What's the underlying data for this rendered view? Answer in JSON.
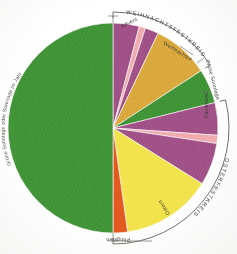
{
  "figure": {
    "type": "pie"
  },
  "arcs": {
    "weihnachtsfestkreis": "WEIHNACHTSFESTKREIS",
    "osterfestkreis": "OSTERFESTKREIS"
  },
  "labels": {
    "advent": "Advent",
    "weihnachten": "Weihnachten",
    "gruene_sonntage_short": "Grüne Sonntage",
    "fastenzeit": "Fastenzeit",
    "ostern": "Ostern",
    "pfingsten": "Pfingsten",
    "gruene_sonntage_long": "Grüne Sonntage oder Sonntage im Jahreskreis"
  },
  "colors": {
    "purple": "#9e4f84",
    "rose": "#efa9ad",
    "gold": "#d9a63c",
    "green": "#3f9136",
    "yellow": "#f2e34a",
    "orange": "#e2571f",
    "ink": "#3b3b36",
    "rule": "#5b5b55",
    "paper": "#ffffff"
  },
  "chart_data": {
    "type": "pie",
    "center": [
      113,
      128
    ],
    "radius": 105,
    "start_angle_deg": 0,
    "direction": "clockwise",
    "unit": "degrees",
    "legend": "none",
    "grid": false,
    "slices": [
      {
        "name": "Advent",
        "color": "#9e4f84",
        "start_deg": 0,
        "end_deg": 14.5,
        "value": 14.5
      },
      {
        "name": "Gaudete",
        "color": "#efa9ad",
        "start_deg": 14.5,
        "end_deg": 18.0,
        "value": 3.5
      },
      {
        "name": "Advent (Fortsetzung)",
        "color": "#9e4f84",
        "start_deg": 18.0,
        "end_deg": 25.5,
        "value": 7.5
      },
      {
        "name": "Weihnachten",
        "color": "#d9a63c",
        "start_deg": 25.5,
        "end_deg": 57.0,
        "value": 31.5
      },
      {
        "name": "Grüne Sonntage",
        "color": "#3f9136",
        "start_deg": 57.0,
        "end_deg": 76.0,
        "value": 19.0
      },
      {
        "name": "Fastenzeit",
        "color": "#9e4f84",
        "start_deg": 76.0,
        "end_deg": 94.0,
        "value": 18.0
      },
      {
        "name": "Laetare",
        "color": "#efa9ad",
        "start_deg": 94.0,
        "end_deg": 98.5,
        "value": 4.5
      },
      {
        "name": "Fastenzeit (Fortsetzung)",
        "color": "#9e4f84",
        "start_deg": 98.5,
        "end_deg": 122.0,
        "value": 23.5
      },
      {
        "name": "Ostern",
        "color": "#f2e34a",
        "start_deg": 122.0,
        "end_deg": 172.0,
        "value": 50.0
      },
      {
        "name": "Pfingsten",
        "color": "#e2571f",
        "start_deg": 172.0,
        "end_deg": 180.0,
        "value": 8.0
      },
      {
        "name": "Grüne Sonntage oder Sonntage im Jahreskreis",
        "color": "#3f9136",
        "start_deg": 180.0,
        "end_deg": 360.0,
        "value": 180.0
      }
    ],
    "brackets": [
      {
        "label": "WEIHNACHTSFESTKREIS",
        "start_deg": 0,
        "end_deg": 57
      },
      {
        "label": "OSTERFESTKREIS",
        "start_deg": 76,
        "end_deg": 180
      }
    ]
  }
}
